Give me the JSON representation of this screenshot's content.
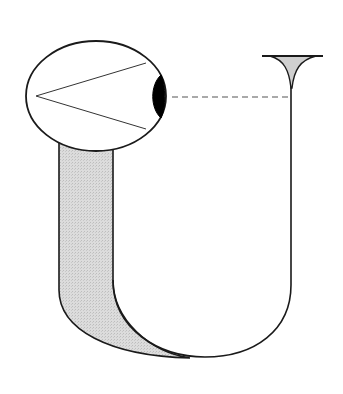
{
  "diagram": {
    "title": "",
    "colors": {
      "stroke": "#1a1a1a",
      "tube_fill": "#d9d9d9",
      "funnel_fill": "#cfcfcf",
      "lens_fill": "#000000",
      "background": "#ffffff"
    },
    "elements": [
      "eye",
      "lens",
      "sight-cone",
      "tube",
      "funnel",
      "dashed-sight-line"
    ]
  }
}
